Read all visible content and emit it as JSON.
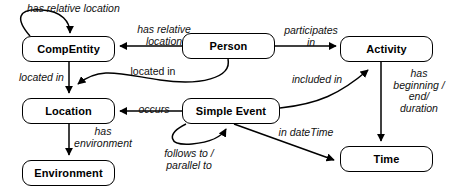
{
  "diagram": {
    "stroke_color": "#000000",
    "background_color": "#ffffff",
    "nodes": [
      {
        "id": "compentity",
        "label": "CompEntity",
        "x": 22,
        "y": 36,
        "w": 93,
        "h": 26
      },
      {
        "id": "person",
        "label": "Person",
        "x": 182,
        "y": 33,
        "w": 93,
        "h": 26
      },
      {
        "id": "activity",
        "label": "Activity",
        "x": 340,
        "y": 36,
        "w": 93,
        "h": 26
      },
      {
        "id": "location",
        "label": "Location",
        "x": 22,
        "y": 98,
        "w": 93,
        "h": 26
      },
      {
        "id": "simpleevent",
        "label": "Simple Event",
        "x": 182,
        "y": 98,
        "w": 98,
        "h": 26
      },
      {
        "id": "time",
        "label": "Time",
        "x": 340,
        "y": 146,
        "w": 93,
        "h": 26
      },
      {
        "id": "environment",
        "label": "Environment",
        "x": 22,
        "y": 160,
        "w": 93,
        "h": 26
      }
    ],
    "edges": [
      {
        "id": "compentity-self",
        "from": "compentity",
        "to": "compentity",
        "label": "has relative location"
      },
      {
        "id": "person-compentity",
        "from": "person",
        "to": "compentity",
        "label": "has relative\nlocation"
      },
      {
        "id": "person-activity",
        "from": "person",
        "to": "activity",
        "label": "participates\nin"
      },
      {
        "id": "compentity-location",
        "from": "compentity",
        "to": "location",
        "label": "located in"
      },
      {
        "id": "person-location",
        "from": "person",
        "to": "location",
        "label": "located in"
      },
      {
        "id": "simpleevent-location",
        "from": "simpleevent",
        "to": "location",
        "label": "occurs"
      },
      {
        "id": "simpleevent-activity",
        "from": "simpleevent",
        "to": "activity",
        "label": "included in"
      },
      {
        "id": "activity-time",
        "from": "activity",
        "to": "time",
        "label": "has\nbeginning /\nend/\nduration"
      },
      {
        "id": "simpleevent-time",
        "from": "simpleevent",
        "to": "time",
        "label": "in dateTime"
      },
      {
        "id": "simpleevent-self",
        "from": "simpleevent",
        "to": "simpleevent",
        "label": "follows to /\nparallel to"
      },
      {
        "id": "location-environment",
        "from": "location",
        "to": "environment",
        "label": "has\nenvironment"
      }
    ],
    "labels": {
      "compentity_self": {
        "text": "has relative location",
        "x": 27,
        "y": 3,
        "w": 130,
        "align": "left"
      },
      "person_compentity": {
        "text": "has relative\nlocation",
        "x": 124,
        "y": 24,
        "w": 80,
        "align": "center"
      },
      "person_activity": {
        "text": "participates\nin",
        "x": 281,
        "y": 25,
        "w": 60,
        "align": "center"
      },
      "compentity_location": {
        "text": "located in",
        "x": 19,
        "y": 72,
        "w": 56,
        "align": "left"
      },
      "person_location": {
        "text": "located in",
        "x": 124,
        "y": 66,
        "w": 58,
        "align": "center"
      },
      "simpleevent_location": {
        "text": "occurs",
        "x": 133,
        "y": 105,
        "w": 42,
        "align": "center"
      },
      "simpleevent_activity": {
        "text": "included in",
        "x": 286,
        "y": 74,
        "w": 60,
        "align": "center"
      },
      "activity_time": {
        "text": "has\nbeginning /\nend/\nduration",
        "x": 388,
        "y": 68,
        "w": 62,
        "align": "center"
      },
      "simpleevent_time": {
        "text": "in dateTime",
        "x": 272,
        "y": 127,
        "w": 66,
        "align": "center"
      },
      "simpleevent_self": {
        "text": "follows to /\nparallel to",
        "x": 155,
        "y": 148,
        "w": 66,
        "align": "center"
      },
      "location_environment": {
        "text": "has\nenvironment",
        "x": 60,
        "y": 126,
        "w": 86,
        "align": "center"
      }
    }
  }
}
